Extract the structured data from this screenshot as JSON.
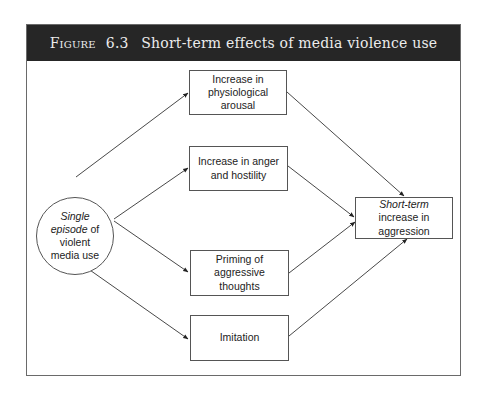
{
  "figure": {
    "label": "Figure",
    "number": "6.3",
    "title": "Short-term effects of media violence use"
  },
  "source_node": {
    "line1_italic": "Single",
    "line2_italic": "episode",
    "line2_rest": " of",
    "line3": "violent",
    "line4": "media use"
  },
  "mediators": [
    {
      "text": "Increase in physiological arousal"
    },
    {
      "text": "Increase in anger and hostility"
    },
    {
      "text": "Priming of aggressive thoughts"
    },
    {
      "text": "Imitation"
    }
  ],
  "outcome_node": {
    "italic": "Short-term",
    "rest": " increase in aggression"
  },
  "colors": {
    "header_bg": "#262626",
    "header_text": "#ececec",
    "line": "#333333"
  }
}
